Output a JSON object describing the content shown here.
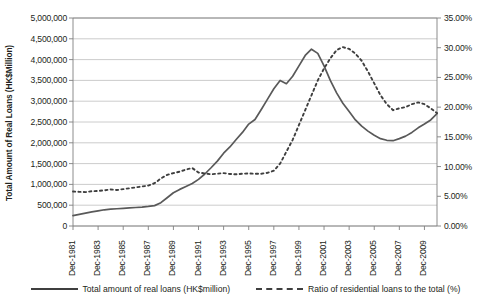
{
  "chart_data": {
    "type": "line",
    "title": "",
    "subtitle": "",
    "xlabel": "",
    "ylabel": "Total Amount of Real Loans (HK$Million)",
    "ylabel_right": "",
    "grid": true,
    "legend_position": "bottom",
    "ylim": [
      0,
      5000000
    ],
    "ylim_right": [
      0,
      0.35
    ],
    "ytick_labels": [
      "0",
      "500,000",
      "1,000,000",
      "1,500,000",
      "2,000,000",
      "2,500,000",
      "3,000,000",
      "3,500,000",
      "4,000,000",
      "4,500,000",
      "5,000,000"
    ],
    "ytick_values": [
      0,
      500000,
      1000000,
      1500000,
      2000000,
      2500000,
      3000000,
      3500000,
      4000000,
      4500000,
      5000000
    ],
    "ytick_right_labels": [
      "0.00%",
      "5.00%",
      "10.00%",
      "15.00%",
      "20.00%",
      "25.00%",
      "30.00%",
      "35.00%"
    ],
    "ytick_right_values": [
      0,
      0.05,
      0.1,
      0.15,
      0.2,
      0.25,
      0.3,
      0.35
    ],
    "xtick_labels": [
      "Dec-1981",
      "Dec-1983",
      "Dec-1985",
      "Dec-1987",
      "Dec-1989",
      "Dec-1991",
      "Dec-1993",
      "Dec-1995",
      "Dec-1997",
      "Dec-1999",
      "Dec-2001",
      "Dec-2003",
      "Dec-2005",
      "Dec-2007",
      "Dec-2009"
    ],
    "x_start_year": 1981,
    "x_end_year": 2010,
    "series": [
      {
        "name": "Total amount of real loans (HK$million)",
        "axis": "left",
        "style": "solid",
        "color": "#595959",
        "x": [
          1981.0,
          1981.5,
          1982.0,
          1982.5,
          1983.0,
          1983.5,
          1984.0,
          1984.5,
          1985.0,
          1985.5,
          1986.0,
          1986.5,
          1987.0,
          1987.5,
          1988.0,
          1988.5,
          1989.0,
          1989.5,
          1990.0,
          1990.5,
          1991.0,
          1991.5,
          1992.0,
          1992.5,
          1993.0,
          1993.5,
          1994.0,
          1994.5,
          1995.0,
          1995.5,
          1996.0,
          1996.5,
          1997.0,
          1997.5,
          1998.0,
          1998.5,
          1999.0,
          1999.5,
          2000.0,
          2000.5,
          2001.0,
          2001.5,
          2002.0,
          2002.5,
          2003.0,
          2003.5,
          2004.0,
          2004.5,
          2005.0,
          2005.5,
          2006.0,
          2006.5,
          2007.0,
          2007.5,
          2008.0,
          2008.5,
          2009.0,
          2009.5,
          2010.0
        ],
        "values": [
          250000,
          280000,
          310000,
          340000,
          365000,
          390000,
          405000,
          415000,
          425000,
          435000,
          445000,
          455000,
          470000,
          490000,
          560000,
          680000,
          800000,
          880000,
          950000,
          1020000,
          1120000,
          1250000,
          1400000,
          1560000,
          1750000,
          1900000,
          2080000,
          2250000,
          2450000,
          2560000,
          2800000,
          3050000,
          3300000,
          3500000,
          3420000,
          3600000,
          3850000,
          4100000,
          4250000,
          4150000,
          3850000,
          3500000,
          3200000,
          2950000,
          2750000,
          2550000,
          2400000,
          2280000,
          2180000,
          2100000,
          2060000,
          2050000,
          2100000,
          2160000,
          2250000,
          2360000,
          2450000,
          2550000,
          2700000
        ]
      },
      {
        "name": "Ratio of residential loans to the total (%)",
        "axis": "right",
        "style": "dashed",
        "color": "#3f3f3f",
        "x": [
          1981.0,
          1981.5,
          1982.0,
          1982.5,
          1983.0,
          1983.5,
          1984.0,
          1984.5,
          1985.0,
          1985.5,
          1986.0,
          1986.5,
          1987.0,
          1987.5,
          1988.0,
          1988.5,
          1989.0,
          1989.5,
          1990.0,
          1990.5,
          1991.0,
          1991.5,
          1992.0,
          1992.5,
          1993.0,
          1993.5,
          1994.0,
          1994.5,
          1995.0,
          1995.5,
          1996.0,
          1996.5,
          1997.0,
          1997.5,
          1998.0,
          1998.5,
          1999.0,
          1999.5,
          2000.0,
          2000.5,
          2001.0,
          2001.5,
          2002.0,
          2002.5,
          2003.0,
          2003.5,
          2004.0,
          2004.5,
          2005.0,
          2005.5,
          2006.0,
          2006.5,
          2007.0,
          2007.5,
          2008.0,
          2008.5,
          2009.0,
          2009.5,
          2010.0
        ],
        "values": [
          0.057,
          0.0565,
          0.056,
          0.0572,
          0.058,
          0.059,
          0.06,
          0.0595,
          0.0605,
          0.0625,
          0.064,
          0.066,
          0.067,
          0.071,
          0.079,
          0.085,
          0.088,
          0.09,
          0.092,
          0.095,
          0.089,
          0.087,
          0.0855,
          0.086,
          0.087,
          0.086,
          0.0855,
          0.0865,
          0.0875,
          0.087,
          0.0865,
          0.088,
          0.0905,
          0.089,
          0.088,
          0.089,
          0.0885,
          0.089,
          0.09,
          0.0905,
          0.09,
          0.0895,
          0.089,
          0.089,
          0.0885,
          0.089,
          0.0895,
          0.089,
          0.0885,
          0.089,
          0.0895,
          0.089,
          0.0885,
          0.089,
          0.0895,
          0.09,
          0.089,
          0.0885,
          0.089
        ]
      }
    ],
    "series_right_override": {
      "note": "dashed ratio curve actual shape",
      "x": [
        1981.0,
        1981.5,
        1982.0,
        1982.5,
        1983.0,
        1983.5,
        1984.0,
        1984.5,
        1985.0,
        1985.5,
        1986.0,
        1986.5,
        1987.0,
        1987.5,
        1988.0,
        1988.5,
        1989.0,
        1989.5,
        1990.0,
        1990.5,
        1991.0,
        1991.5,
        1992.0,
        1992.5,
        1993.0,
        1993.5,
        1994.0,
        1994.5,
        1995.0,
        1995.5,
        1996.0,
        1996.5,
        1997.0,
        1997.5,
        1998.0,
        1998.5,
        1999.0,
        1999.5,
        2000.0,
        2000.5,
        2001.0,
        2001.5,
        2002.0,
        2002.5,
        2003.0,
        2003.5,
        2004.0,
        2004.5,
        2005.0,
        2005.5,
        2006.0,
        2006.5,
        2007.0,
        2007.5,
        2008.0,
        2008.5,
        2009.0,
        2009.5,
        2010.0
      ],
      "values": [
        0.058,
        0.0575,
        0.057,
        0.0585,
        0.059,
        0.06,
        0.0615,
        0.0605,
        0.062,
        0.0635,
        0.065,
        0.0665,
        0.068,
        0.072,
        0.08,
        0.086,
        0.089,
        0.0915,
        0.095,
        0.0975,
        0.09,
        0.0885,
        0.087,
        0.088,
        0.089,
        0.0875,
        0.087,
        0.088,
        0.0885,
        0.088,
        0.088,
        0.0895,
        0.093,
        0.105,
        0.125,
        0.145,
        0.17,
        0.195,
        0.22,
        0.245,
        0.265,
        0.282,
        0.296,
        0.301,
        0.298,
        0.29,
        0.278,
        0.26,
        0.24,
        0.22,
        0.205,
        0.195,
        0.198,
        0.2,
        0.205,
        0.208,
        0.205,
        0.198,
        0.19
      ]
    }
  },
  "legend": {
    "items": [
      {
        "label": "Total amount of real loans (HK$million)",
        "style": "solid"
      },
      {
        "label": "Ratio of residential loans to the total (%)",
        "style": "dashed"
      }
    ]
  },
  "axis_titles": {
    "left": "Total Amount of Real Loans (HK$Million)"
  },
  "colors": {
    "line_solid": "#595959",
    "line_dashed": "#3f3f3f",
    "grid": "#bfbfbf",
    "axis": "#808080",
    "text": "#231f20",
    "background": "#ffffff"
  }
}
